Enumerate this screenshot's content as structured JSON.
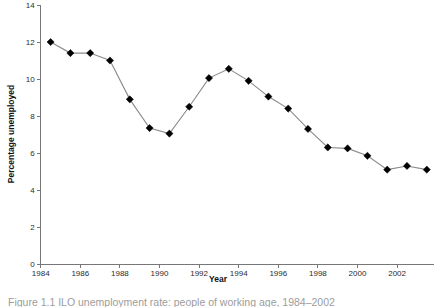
{
  "figure": {
    "caption": "Figure 1.1 ILO unemployment rate: people of working age, 1984–2002"
  },
  "chart_data": {
    "type": "line",
    "title": "",
    "xlabel": "Year",
    "ylabel": "Percentage unemployed",
    "xlim": [
      1984,
      2004
    ],
    "ylim": [
      0,
      14
    ],
    "ytick_step": 2,
    "xtick_step": 2,
    "yticks": [
      "0",
      "2",
      "4",
      "6",
      "8",
      "10",
      "12",
      "14"
    ],
    "xticks": [
      "1984",
      "1986",
      "1988",
      "1990",
      "1992",
      "1994",
      "1996",
      "1998",
      "2000",
      "2002"
    ],
    "grid": false,
    "legend": false,
    "marker": "diamond",
    "marker_color": "#000000",
    "line_color": "#8a8a8a",
    "x": [
      1984.5,
      1985.5,
      1986.5,
      1987.5,
      1988.5,
      1989.5,
      1990.5,
      1991.5,
      1992.5,
      1993.5,
      1994.5,
      1995.5,
      1996.5,
      1997.5,
      1998.5,
      1999.5,
      2000.5,
      2001.5,
      2002.5,
      2003.5
    ],
    "values": [
      12.0,
      11.4,
      11.4,
      11.0,
      8.9,
      7.35,
      7.05,
      8.5,
      10.05,
      10.55,
      9.9,
      9.05,
      8.4,
      7.3,
      6.3,
      6.25,
      5.85,
      5.1,
      5.3,
      5.1
    ]
  }
}
